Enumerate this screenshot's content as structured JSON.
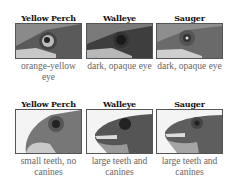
{
  "rows": [
    {
      "feature": "eye",
      "cells": [
        {
          "species": "Yellow Perch",
          "caption": "orange-yellow eye"
        },
        {
          "species": "Walleye",
          "caption": "dark, opaque eye"
        },
        {
          "species": "Sauger",
          "caption": "dark, opaque eye"
        }
      ]
    },
    {
      "feature": "teeth",
      "cells": [
        {
          "species": "Yellow Perch",
          "caption": "small teeth, no canines"
        },
        {
          "species": "Walleye",
          "caption": "large teeth and canines"
        },
        {
          "species": "Sauger",
          "caption": "large teeth and canines"
        }
      ]
    }
  ]
}
